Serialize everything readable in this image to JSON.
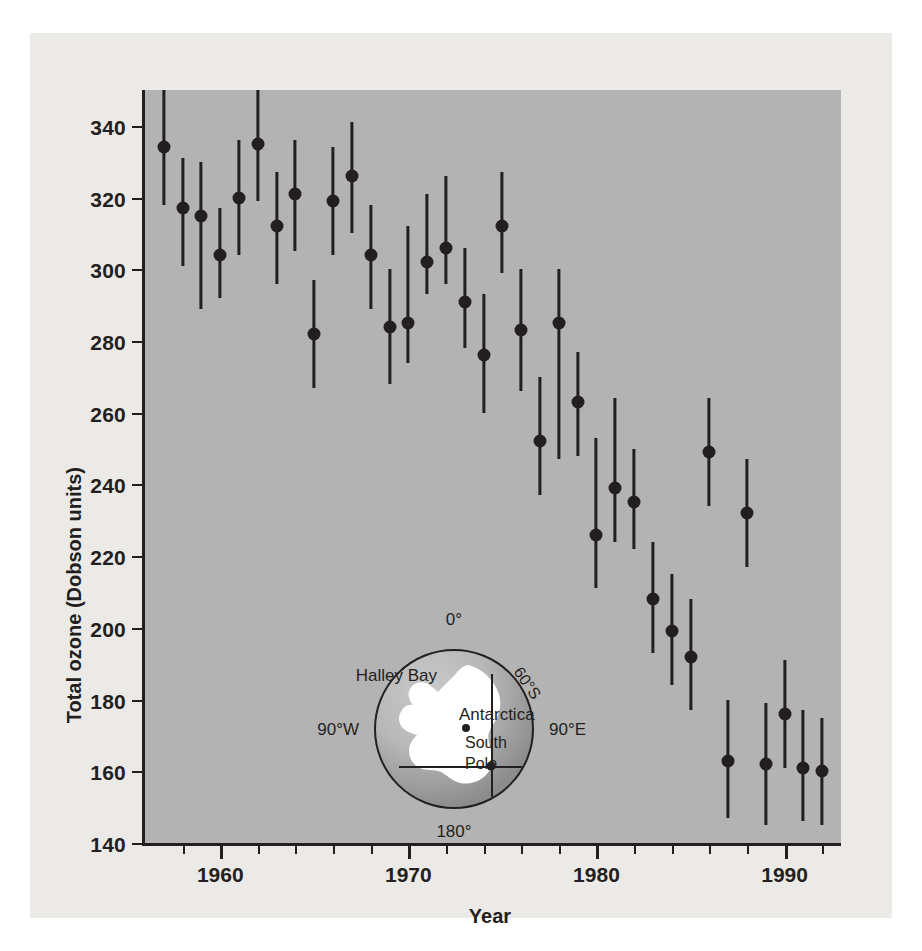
{
  "chart_data": {
    "type": "scatter",
    "title": "",
    "xlabel": "Year",
    "ylabel": "Total ozone (Dobson units)",
    "xlim": [
      1956,
      1993
    ],
    "ylim": [
      140,
      350
    ],
    "grid": false,
    "legend": null,
    "series_note": "Mean October total ozone over Halley Bay, Antarctica, with vertical bars showing range/uncertainty",
    "x": [
      1957,
      1958,
      1959,
      1960,
      1961,
      1962,
      1963,
      1964,
      1965,
      1966,
      1967,
      1968,
      1969,
      1970,
      1971,
      1972,
      1973,
      1974,
      1975,
      1976,
      1977,
      1978,
      1979,
      1980,
      1981,
      1982,
      1983,
      1984,
      1985,
      1986,
      1987,
      1988,
      1989,
      1990,
      1991,
      1992
    ],
    "values": [
      334,
      317,
      315,
      304,
      320,
      335,
      312,
      321,
      282,
      319,
      326,
      304,
      284,
      285,
      302,
      306,
      291,
      276,
      312,
      283,
      252,
      285,
      263,
      226,
      239,
      235,
      208,
      199,
      192,
      249,
      163,
      232,
      162,
      176,
      161,
      160
    ],
    "err_low": [
      318,
      301,
      289,
      292,
      304,
      319,
      296,
      305,
      267,
      304,
      310,
      289,
      268,
      274,
      293,
      296,
      278,
      260,
      299,
      266,
      237,
      247,
      248,
      211,
      224,
      222,
      193,
      184,
      177,
      234,
      147,
      217,
      145,
      161,
      146,
      145
    ],
    "err_high": [
      350,
      331,
      330,
      317,
      336,
      350,
      327,
      336,
      297,
      334,
      341,
      318,
      300,
      312,
      321,
      326,
      306,
      293,
      327,
      300,
      270,
      300,
      277,
      253,
      264,
      250,
      224,
      215,
      208,
      264,
      180,
      247,
      179,
      191,
      177,
      175
    ],
    "xticks_major": [
      1960,
      1970,
      1980,
      1990
    ],
    "xticks_minor": [
      1958,
      1962,
      1964,
      1966,
      1968,
      1972,
      1974,
      1976,
      1978,
      1982,
      1984,
      1986,
      1988,
      1992
    ],
    "xtick_labels": [
      "1960",
      "1970",
      "1980",
      "1990"
    ],
    "yticks": [
      140,
      160,
      180,
      200,
      220,
      240,
      260,
      280,
      300,
      320,
      340
    ],
    "ytick_labels": [
      "140",
      "160",
      "180",
      "200",
      "220",
      "240",
      "260",
      "280",
      "300",
      "320",
      "340"
    ]
  },
  "axes": {
    "y_title": "Total ozone (Dobson units)",
    "x_title": "Year"
  },
  "inset_map": {
    "name": "antarctica-polar-map",
    "labels": {
      "top": "0°",
      "bottom": "180°",
      "left": "90°W",
      "right": "90°E",
      "latitude_circle": "60°S",
      "station": "Halley Bay",
      "continent": "Antarctica",
      "pole_line1": "South",
      "pole_line2": "Pole"
    }
  },
  "colors": {
    "page_background": "#ffffff",
    "figure_background": "#eceae7",
    "plot_background": "#b3b3b3",
    "ink": "#231f20",
    "landmass": "#ffffff",
    "ocean_shadow": "#8d8d8d"
  }
}
